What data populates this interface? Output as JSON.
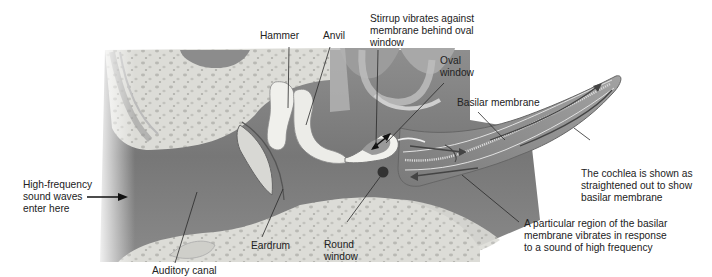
{
  "diagram": {
    "title": "",
    "colors": {
      "background": "#ffffff",
      "bone": "#d9d9d4",
      "bone_spots": "#b7b7b2",
      "canal": "#7d7d7d",
      "ossicles": "#eeeeea",
      "cochlea": "#8a8a8a",
      "arrows": "#3a3a3a",
      "leader_lines": "#2a2a2a",
      "text": "#222222"
    },
    "labels": {
      "hammer": "Hammer",
      "anvil": "Anvil",
      "stirrup": [
        "Stirrup vibrates against",
        "membrane behind oval",
        "window"
      ],
      "oval_window": [
        "Oval",
        "window"
      ],
      "basilar_membrane": "Basilar membrane",
      "cochlea_note": [
        "The cochlea is shown as",
        "straightened out to show",
        "basilar membrane"
      ],
      "sound_waves": [
        "High-frequency",
        "sound waves",
        "enter here"
      ],
      "eardrum": "Eardrum",
      "round_window": [
        "Round",
        "window"
      ],
      "region_note": [
        "A particular region of the basilar",
        "membrane vibrates in response",
        "to a sound of high frequency"
      ],
      "auditory_canal": "Auditory canal"
    }
  }
}
